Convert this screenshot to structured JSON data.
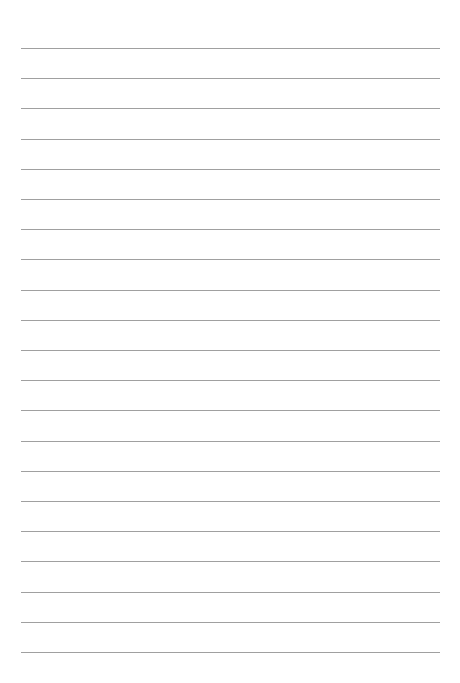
{
  "page": {
    "type": "lined-paper",
    "background_color": "#ffffff",
    "rule_color": "#a0a0a0",
    "rule_count": 21,
    "first_rule_y": 48,
    "rule_spacing": 30.2,
    "rule_left": 21,
    "rule_right": 440,
    "text": []
  }
}
